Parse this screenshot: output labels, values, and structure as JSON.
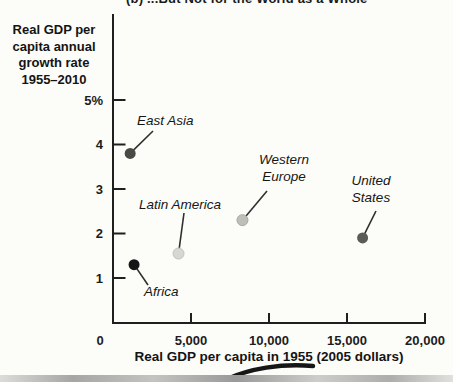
{
  "header": {
    "cropped_title": "(b) ...But Not for the World as a Whole"
  },
  "colors": {
    "axis": "#1f1f1f",
    "text": "#1c1c1c",
    "leader": "#2f2f2f",
    "background": "#fcfcf9",
    "artifact": "#161616"
  },
  "chart_data": {
    "type": "scatter",
    "title_partial": "(b) ...But Not for the World as a Whole",
    "xlabel": "Real GDP per capita in 1955 (2005 dollars)",
    "ylabel_lines": [
      "Real GDP per",
      "capita annual",
      "growth rate",
      "1955–2010"
    ],
    "xlim": [
      0,
      20000
    ],
    "ylim": [
      0,
      5
    ],
    "grid": false,
    "legend": "none",
    "x_ticks": [
      {
        "value": 0,
        "label": "0"
      },
      {
        "value": 5000,
        "label": "5,000"
      },
      {
        "value": 10000,
        "label": "10,000"
      },
      {
        "value": 15000,
        "label": "15,000"
      },
      {
        "value": 20000,
        "label": "20,000"
      }
    ],
    "y_ticks": [
      {
        "value": 5,
        "label": "5%"
      },
      {
        "value": 4,
        "label": "4"
      },
      {
        "value": 3,
        "label": "3"
      },
      {
        "value": 2,
        "label": "2"
      },
      {
        "value": 1,
        "label": "1"
      }
    ],
    "points": [
      {
        "name": "East Asia",
        "gdp_per_capita_1955": 1100,
        "growth_rate_pct": 3.8,
        "color": "#4a4a44",
        "ring": "",
        "label_lines": [
          "East Asia"
        ],
        "label_px": {
          "x": 137,
          "y": 125,
          "anchor": "start"
        },
        "leader_px": {
          "x": 153,
          "y": 131
        }
      },
      {
        "name": "Western Europe",
        "gdp_per_capita_1955": 8300,
        "growth_rate_pct": 2.3,
        "color": "#bfbfba",
        "ring": "#a8a8a2",
        "label_lines": [
          "Western",
          "Europe"
        ],
        "label_px": {
          "x": 284,
          "y": 164,
          "anchor": "middle"
        },
        "leader_px": {
          "x": 267,
          "y": 191
        }
      },
      {
        "name": "United States",
        "gdp_per_capita_1955": 16000,
        "growth_rate_pct": 1.9,
        "color": "#5c5c56",
        "ring": "",
        "label_lines": [
          "United",
          "States"
        ],
        "label_px": {
          "x": 371,
          "y": 185,
          "anchor": "middle"
        },
        "leader_px": {
          "x": 376,
          "y": 211
        }
      },
      {
        "name": "Latin America",
        "gdp_per_capita_1955": 4200,
        "growth_rate_pct": 1.55,
        "color": "#d7d7d2",
        "ring": "#c2c2bc",
        "label_lines": [
          "Latin America"
        ],
        "label_px": {
          "x": 139,
          "y": 209,
          "anchor": "start"
        },
        "leader_px": {
          "x": 184,
          "y": 213
        }
      },
      {
        "name": "Africa",
        "gdp_per_capita_1955": 1350,
        "growth_rate_pct": 1.3,
        "color": "#161616",
        "ring": "",
        "label_lines": [
          "Africa"
        ],
        "label_px": {
          "x": 144,
          "y": 296,
          "anchor": "start"
        },
        "leader_px": {
          "x": 148,
          "y": 285
        }
      }
    ]
  }
}
